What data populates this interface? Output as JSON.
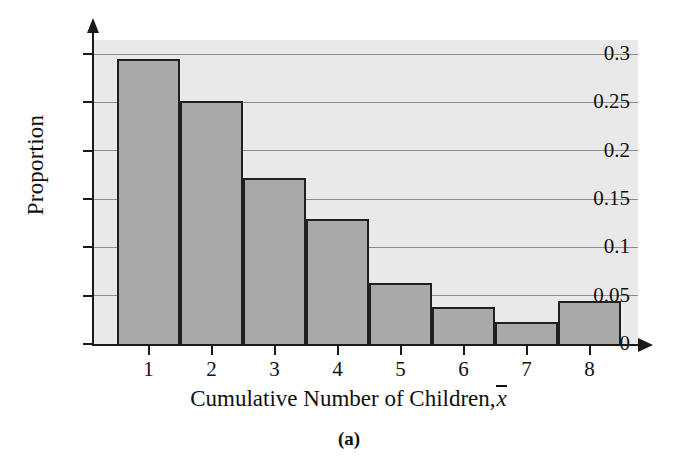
{
  "figure": {
    "subcaption": "(a)"
  },
  "chart_data": {
    "type": "bar",
    "title": "",
    "xlabel": "Cumulative Number of Children,",
    "xlabel_symbol": "x",
    "ylabel": "Proportion",
    "categories": [
      "1",
      "2",
      "3",
      "4",
      "5",
      "6",
      "7",
      "8"
    ],
    "values": [
      0.295,
      0.251,
      0.172,
      0.129,
      0.063,
      0.038,
      0.023,
      0.044
    ],
    "ylim": [
      0,
      0.3
    ],
    "xlim_categories": 8,
    "ytick_labels": [
      "0",
      "0.05",
      "0.1",
      "0.15",
      "0.2",
      "0.25",
      "0.3"
    ],
    "ytick_values": [
      0,
      0.05,
      0.1,
      0.15,
      0.2,
      0.25,
      0.3
    ],
    "grid": true,
    "legend": "none",
    "bar_fill_color": "#a9a9a9",
    "bar_edge_color": "#1f1f1f",
    "panel_background_color": "#e9e9e9",
    "gridline_color": "#8d8d8d",
    "axis_color": "#1a1a1a"
  }
}
